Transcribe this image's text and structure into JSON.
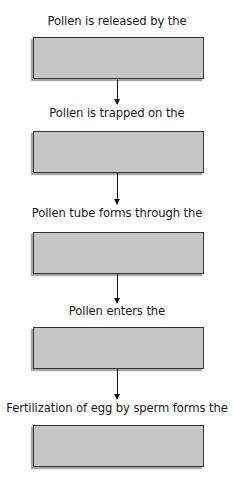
{
  "diagram": {
    "type": "flowchart",
    "direction": "top-to-bottom",
    "colors": {
      "box_fill": "#c6c6c6",
      "box_border": "#333333",
      "arrow": "#111111",
      "text": "#1a1a1a"
    },
    "steps": [
      {
        "label": "Pollen is released by the",
        "answer": ""
      },
      {
        "label": "Pollen is trapped on the",
        "answer": ""
      },
      {
        "label": "Pollen tube forms through the",
        "answer": ""
      },
      {
        "label": "Pollen enters the",
        "answer": ""
      },
      {
        "label": "Fertilization of egg by sperm forms the",
        "answer": ""
      }
    ]
  }
}
